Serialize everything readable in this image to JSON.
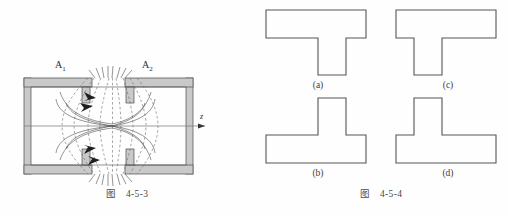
{
  "page": {
    "background_color": "#fefefe",
    "ink_color": "#2b2b2b"
  },
  "figure_left": {
    "caption_prefix": "图",
    "caption_number": "4-5-3",
    "title_full": "图 4-5-3",
    "description": "Electrostatic lens cross-section with two electrodes A1 and A2, dashed equipotential lines and solid electric field lines, symmetry axis z pointing right",
    "electrodes": [
      {
        "name": "electrode-a1",
        "label": "A",
        "subscript": "1"
      },
      {
        "name": "electrode-a2",
        "label": "A",
        "subscript": "2"
      }
    ],
    "axis": {
      "name": "z-axis",
      "label": "z",
      "direction": "right"
    },
    "colors": {
      "wall_fill": "#c9c9c9",
      "wall_stroke": "#4a4a4a",
      "field_line": "#4d4d4d",
      "equipotential": "#6b6b6b",
      "axis": "#777777"
    }
  },
  "figure_right": {
    "caption_prefix": "图",
    "caption_number": "4-5-4",
    "title_full": "图 4-5-4",
    "description": "Four T-shaped cross sections labelled (a) through (d)",
    "outline_color": "#555555",
    "shapes": [
      {
        "name": "shape-a",
        "label": "(a)",
        "orientation": "flange-top",
        "stem_alignment": "center",
        "flange": {
          "x": 8,
          "y": 8,
          "width": 100,
          "height": 28
        },
        "stem": {
          "x": 60,
          "y": 36,
          "width": 28,
          "height": 37
        }
      },
      {
        "name": "shape-c",
        "label": "(c)",
        "orientation": "flange-top",
        "stem_alignment": "left-offset",
        "flange": {
          "x": 8,
          "y": 8,
          "width": 100,
          "height": 28
        },
        "stem": {
          "x": 26,
          "y": 36,
          "width": 28,
          "height": 37
        }
      },
      {
        "name": "shape-b",
        "label": "(b)",
        "orientation": "flange-bottom",
        "stem_alignment": "center",
        "stem": {
          "x": 60,
          "y": 8,
          "width": 28,
          "height": 37
        },
        "flange": {
          "x": 8,
          "y": 45,
          "width": 100,
          "height": 28
        }
      },
      {
        "name": "shape-d",
        "label": "(d)",
        "orientation": "flange-bottom",
        "stem_alignment": "left-offset",
        "stem": {
          "x": 26,
          "y": 8,
          "width": 28,
          "height": 37
        },
        "flange": {
          "x": 8,
          "y": 45,
          "width": 100,
          "height": 28
        }
      }
    ]
  }
}
